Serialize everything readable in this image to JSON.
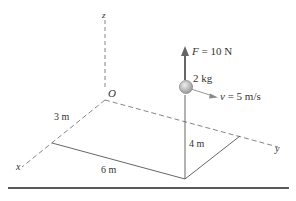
{
  "figure": {
    "axes": {
      "origin_label": "O",
      "x_label": "x",
      "y_label": "y",
      "z_label": "z"
    },
    "dimensions": {
      "x_offset": "3 m",
      "y_offset": "6 m",
      "height": "4 m"
    },
    "particle": {
      "mass": "2 kg",
      "force_symbol": "F",
      "force_value": " = 10 N",
      "velocity_symbol": "v",
      "velocity_value": " = 5 m/s"
    },
    "colors": {
      "line": "#555555",
      "dashed": "#777777",
      "force_arrow": "#666666",
      "ball_fill": "#bdbdbd",
      "ball_stroke": "#888888",
      "baseline": "#222222",
      "text": "#333333"
    }
  }
}
